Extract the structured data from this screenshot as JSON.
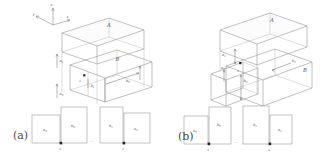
{
  "figure": {
    "background": "#ffffff",
    "line_color": "#8e8e8e",
    "label_color": "#555555",
    "marker_color": "#222222"
  },
  "panels": [
    {
      "id": "a",
      "tag": "(a)",
      "axes": {
        "x": "x",
        "y": "y",
        "z": "z"
      },
      "solid": {
        "upper_block_label": "A",
        "lower_block_label": "B",
        "dimension_labels": [
          {
            "name": "a1",
            "text": "a",
            "sub": "1"
          },
          {
            "name": "a0",
            "text": "a",
            "sub": "0"
          },
          {
            "name": "b1",
            "text": "b",
            "sub": "1"
          },
          {
            "name": "b0",
            "text": "b",
            "sub": "0"
          }
        ],
        "origin_label": "x"
      },
      "strips": [
        {
          "label": "a",
          "sub": "0",
          "marked": false
        },
        {
          "label": "b",
          "sub": "0",
          "marked": true,
          "mark_label": "x"
        },
        {
          "label": "b",
          "sub": "1",
          "marked": false
        },
        {
          "label": "a",
          "sub": "1",
          "marked": true,
          "mark_label": "x"
        }
      ],
      "ellipsis": "..."
    },
    {
      "id": "b",
      "tag": "(b)",
      "axes": {
        "x": "",
        "y": "",
        "z": ""
      },
      "solid": {
        "upper_block_label": "A",
        "lower_block_label": "B",
        "dimension_labels": [
          {
            "name": "a1",
            "text": "a",
            "sub": "1"
          },
          {
            "name": "a0",
            "text": "a",
            "sub": "0"
          },
          {
            "name": "b0",
            "text": "b",
            "sub": "0"
          },
          {
            "name": "b1",
            "text": "b",
            "sub": "1"
          }
        ],
        "origin_label": "x"
      },
      "strips": [
        {
          "label": "a",
          "sub": "0",
          "marked": false
        },
        {
          "label": "b",
          "sub": "0",
          "marked": true,
          "mark_label": "x"
        },
        {
          "label": "b",
          "sub": "1",
          "marked": false
        },
        {
          "label": "a",
          "sub": "1",
          "marked": true,
          "mark_label": "x"
        }
      ],
      "ellipsis": "..."
    }
  ]
}
